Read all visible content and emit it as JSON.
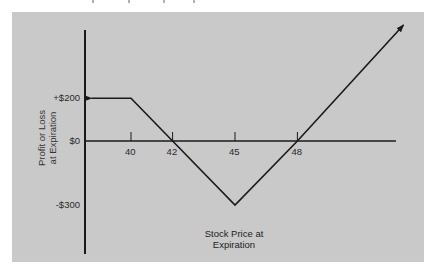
{
  "chart_data": {
    "type": "line",
    "title": "",
    "xlabel": "Stock Price at Expiration",
    "ylabel": "Profit or Loss at Expiration",
    "xlabel_lines": [
      "Stock Price at",
      "Expiration"
    ],
    "ylabel_lines": [
      "Profit or Loss",
      "at Expiration"
    ],
    "x_ticks": [
      40,
      42,
      45,
      48
    ],
    "x_tick_labels": [
      "40",
      "42",
      "45",
      "48"
    ],
    "y_ticks": [
      200,
      0,
      -300
    ],
    "y_tick_labels": [
      "+$200",
      "$0",
      "-$300"
    ],
    "series": [
      {
        "name": "Payoff",
        "x": [
          38.1,
          40,
          42,
          45,
          48,
          53.1
        ],
        "y": [
          200,
          200,
          0,
          -300,
          0,
          544
        ],
        "left_arrow": true,
        "right_arrow": true
      }
    ],
    "key_points": [
      {
        "x": 40,
        "y": 200
      },
      {
        "x": 42,
        "y": 0
      },
      {
        "x": 45,
        "y": -300
      },
      {
        "x": 48,
        "y": 0
      }
    ],
    "grid": false,
    "legend": null
  },
  "colors": {
    "panel_background": "#c9c9c9",
    "line": "#1a1a1a",
    "text": "#2a2a2a"
  }
}
